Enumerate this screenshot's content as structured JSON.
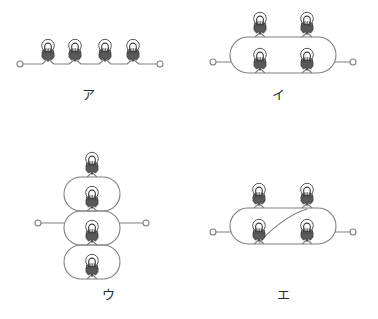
{
  "figure": {
    "title": "",
    "background_color": "#ffffff",
    "wire_color": "#808080",
    "wire_width": 1.1,
    "terminal": {
      "icon": "open-circle-terminal",
      "radius": 3,
      "stroke_color": "#808080",
      "fill_color": "#ffffff"
    },
    "lamp": {
      "icon": "light-bulb-icon",
      "glass_stroke": "#555555",
      "glass_fill": "#ffffff",
      "filament_color": "#3a3a3a",
      "base_fill": "#595959",
      "base_stroke": "#3d3d3d",
      "glass_radius": 6.2,
      "base_width": 12,
      "base_height": 11
    },
    "panels": [
      {
        "id": "a",
        "label": "ア",
        "topology": "series",
        "lamp_count": 4,
        "terminal_count": 2,
        "lamps": [
          {
            "x": 48,
            "y": 48,
            "orientation": "up"
          },
          {
            "x": 75,
            "y": 48,
            "orientation": "up"
          },
          {
            "x": 105,
            "y": 48,
            "orientation": "up"
          },
          {
            "x": 133,
            "y": 48,
            "orientation": "up"
          }
        ],
        "terminals": [
          {
            "x": 20,
            "y": 64
          },
          {
            "x": 160,
            "y": 64
          }
        ]
      },
      {
        "id": "i",
        "label": "イ",
        "topology": "two-parallel-branches-each-with-two-series-lamps",
        "lamp_count": 4,
        "terminal_count": 2,
        "loop": {
          "x": 230,
          "y": 37,
          "width": 106,
          "height": 36,
          "radius": 18
        },
        "lamps": [
          {
            "x": 260,
            "y": 27,
            "orientation": "up",
            "position": "top-left"
          },
          {
            "x": 307,
            "y": 27,
            "orientation": "up",
            "position": "top-right"
          },
          {
            "x": 260,
            "y": 63,
            "orientation": "up",
            "position": "bottom-left"
          },
          {
            "x": 307,
            "y": 63,
            "orientation": "up",
            "position": "bottom-right"
          }
        ],
        "terminals": [
          {
            "x": 213,
            "y": 62
          },
          {
            "x": 353,
            "y": 62
          }
        ]
      },
      {
        "id": "u",
        "label": "ウ",
        "topology": "three-stacked-loops-with-one-lamp-each-plus-top-lamp",
        "lamp_count": 4,
        "terminal_count": 2,
        "loops": [
          {
            "x": 63,
            "y": 177,
            "width": 76,
            "height": 36,
            "radius": 18
          },
          {
            "x": 63,
            "y": 206,
            "width": 76,
            "height": 36,
            "radius": 18
          },
          {
            "x": 63,
            "y": 240,
            "width": 76,
            "height": 36,
            "radius": 18
          }
        ],
        "lamps": [
          {
            "x": 92,
            "y": 163,
            "orientation": "up",
            "position": "top-external"
          },
          {
            "x": 92,
            "y": 190,
            "orientation": "up",
            "position": "loop-1"
          },
          {
            "x": 92,
            "y": 222,
            "orientation": "up",
            "position": "loop-2"
          },
          {
            "x": 92,
            "y": 256,
            "orientation": "up",
            "position": "loop-3"
          }
        ],
        "terminals": [
          {
            "x": 38,
            "y": 223
          },
          {
            "x": 146,
            "y": 223
          }
        ]
      },
      {
        "id": "e",
        "label": "エ",
        "topology": "bridge-circuit-with-diagonal-wire",
        "lamp_count": 4,
        "terminal_count": 2,
        "loop": {
          "x": 230,
          "y": 208,
          "width": 106,
          "height": 36,
          "radius": 18
        },
        "lamps": [
          {
            "x": 259,
            "y": 197,
            "orientation": "up",
            "position": "top-left"
          },
          {
            "x": 307,
            "y": 197,
            "orientation": "up",
            "position": "top-right"
          },
          {
            "x": 259,
            "y": 233,
            "orientation": "up",
            "position": "bottom-left"
          },
          {
            "x": 307,
            "y": 233,
            "orientation": "up",
            "position": "bottom-right"
          }
        ],
        "diagonal": {
          "x1": 307,
          "y1": 208,
          "x2": 259,
          "y2": 244
        },
        "terminals": [
          {
            "x": 213,
            "y": 232
          },
          {
            "x": 353,
            "y": 232
          }
        ]
      }
    ]
  }
}
